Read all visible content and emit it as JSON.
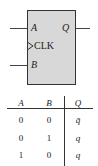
{
  "symbol": {
    "inputs": [
      "A",
      "B"
    ],
    "clock_label": "CLK",
    "output": "Q"
  },
  "truth_table": {
    "headers": [
      "A",
      "B",
      "Q"
    ],
    "rows": [
      [
        "0",
        "0",
        "q̄"
      ],
      [
        "0",
        "1",
        "q"
      ],
      [
        "1",
        "0",
        "q"
      ]
    ]
  }
}
